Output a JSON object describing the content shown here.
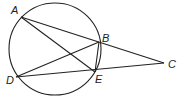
{
  "diagram": {
    "circle": {
      "cx": 55,
      "cy": 49,
      "r": 46
    },
    "points": {
      "A": {
        "x": 21,
        "y": 17,
        "lx": 11,
        "ly": 14
      },
      "B": {
        "x": 99,
        "y": 42,
        "lx": 102,
        "ly": 42
      },
      "C": {
        "x": 164,
        "y": 63,
        "lx": 168,
        "ly": 68
      },
      "D": {
        "x": 16,
        "y": 77,
        "lx": 6,
        "ly": 84
      },
      "E": {
        "x": 95,
        "y": 72,
        "lx": 95,
        "ly": 83
      }
    },
    "segments": [
      [
        "A",
        "C"
      ],
      [
        "A",
        "E"
      ],
      [
        "D",
        "B"
      ],
      [
        "D",
        "C"
      ],
      [
        "B",
        "E"
      ]
    ],
    "labels": {
      "A": "A",
      "B": "B",
      "C": "C",
      "D": "D",
      "E": "E"
    }
  }
}
